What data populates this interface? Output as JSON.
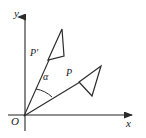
{
  "figure": {
    "width": 146,
    "height": 138,
    "background_color": "#ffffff",
    "stroke_color": "#1a1a1a",
    "axis_color": "#3a3a3a"
  },
  "axes": {
    "x_label": "x",
    "y_label": "y",
    "origin_label": "O",
    "x_axis": {
      "x1": 8,
      "y1": 115,
      "x2": 136,
      "y2": 115,
      "arrow": "right"
    },
    "y_axis": {
      "x1": 25,
      "y1": 131,
      "x2": 25,
      "y2": 11,
      "arrow": "up"
    }
  },
  "labels": {
    "y": {
      "text": "y",
      "x": 14,
      "y": 8
    },
    "x": {
      "text": "x",
      "x": 126,
      "y": 118
    },
    "origin": {
      "text": "O",
      "x": 11,
      "y": 116
    },
    "p_prime": {
      "text": "P′",
      "x": 30,
      "y": 48
    },
    "p": {
      "text": "P",
      "x": 66,
      "y": 68
    },
    "alpha": {
      "text": "α",
      "x": 43,
      "y": 72
    }
  },
  "rays": [
    {
      "name": "ray-to-P-prime",
      "x1": 24,
      "y1": 116,
      "x2": 49,
      "y2": 60
    },
    {
      "name": "ray-to-P",
      "x1": 24,
      "y1": 116,
      "x2": 80,
      "y2": 82
    }
  ],
  "angle_arc": {
    "label": "α",
    "vertex_x": 24,
    "vertex_y": 116,
    "radius": 34,
    "start_x": 36,
    "start_y": 89,
    "end_x": 52,
    "end_y": 97
  },
  "triangles": [
    {
      "name": "rotated-triangle-P-prime",
      "vertex_label": "P′",
      "points": "48,60 62,29 64,56",
      "vertices": [
        {
          "x": 48,
          "y": 60
        },
        {
          "x": 62,
          "y": 29
        },
        {
          "x": 64,
          "y": 56
        }
      ]
    },
    {
      "name": "original-triangle-P",
      "vertex_label": "P",
      "points": "79,82 101,66 92,96",
      "vertices": [
        {
          "x": 79,
          "y": 82
        },
        {
          "x": 101,
          "y": 66
        },
        {
          "x": 92,
          "y": 96
        }
      ]
    }
  ],
  "chart_data": {
    "type": "scatter",
    "xlabel": "x",
    "ylabel": "y",
    "grid": false,
    "legend": "none",
    "annotations": [
      {
        "text": "P",
        "description": "vertex of the original triangle on ray OP"
      },
      {
        "text": "P′",
        "description": "image vertex of the rotated triangle on ray OP′"
      },
      {
        "text": "α",
        "description": "angle of rotation between ray OP and ray OP′"
      },
      {
        "text": "O",
        "description": "origin, center of rotation"
      }
    ],
    "series": [
      {
        "name": "original triangle (P)",
        "x": [
          79,
          101,
          92,
          79
        ],
        "y": [
          82,
          66,
          96,
          82
        ]
      },
      {
        "name": "rotated triangle (P')",
        "x": [
          48,
          62,
          64,
          48
        ],
        "y": [
          60,
          29,
          56,
          60
        ]
      },
      {
        "name": "ray OP",
        "x": [
          24,
          80
        ],
        "y": [
          116,
          82
        ]
      },
      {
        "name": "ray OP'",
        "x": [
          24,
          49
        ],
        "y": [
          116,
          60
        ]
      }
    ]
  }
}
